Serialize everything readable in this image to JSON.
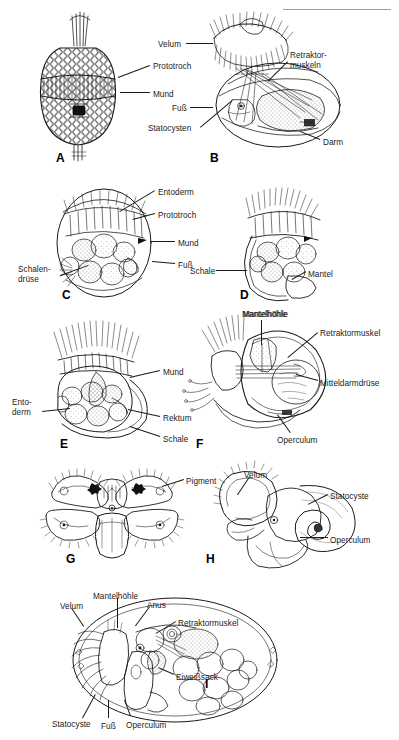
{
  "page": {
    "width": 399,
    "height": 740,
    "background": "#ffffff",
    "ink": "#1a1a1a",
    "header_rule_color": "#9aa0a6",
    "header_text": ""
  },
  "figure": {
    "type": "scientific-illustration-plate",
    "language": "de",
    "panel_count": 9
  },
  "panels": [
    {
      "id": "A",
      "letter": "A",
      "letter_pos": {
        "x": 56,
        "y": 151
      },
      "labels": [
        {
          "text": "Prototroch",
          "x": 153,
          "y": 62,
          "align": "left",
          "leader": {
            "x1": 150,
            "y1": 66,
            "x2": 118,
            "y2": 78
          }
        },
        {
          "text": "Mund",
          "x": 153,
          "y": 90,
          "align": "left",
          "leader": {
            "x1": 150,
            "y1": 93,
            "x2": 120,
            "y2": 93
          }
        }
      ]
    },
    {
      "id": "B",
      "letter": "B",
      "letter_pos": {
        "x": 210,
        "y": 151
      },
      "labels": [
        {
          "text": "Velum",
          "x": 158,
          "y": 40,
          "align": "left",
          "leader": {
            "x1": 186,
            "y1": 43,
            "x2": 213,
            "y2": 43
          }
        },
        {
          "text": "Fuß",
          "x": 172,
          "y": 104,
          "align": "left",
          "leader": {
            "x1": 190,
            "y1": 107,
            "x2": 213,
            "y2": 107
          }
        },
        {
          "text": "Statocysten",
          "x": 148,
          "y": 124,
          "align": "left",
          "leader": {
            "x1": 200,
            "y1": 127,
            "x2": 232,
            "y2": 100
          }
        },
        {
          "text": "Retraktor-",
          "x": 290,
          "y": 51,
          "align": "left",
          "leader": {
            "x1": 288,
            "y1": 62,
            "x2": 268,
            "y2": 82
          }
        },
        {
          "text": "muskeln",
          "x": 290,
          "y": 61,
          "align": "left",
          "leader": null
        },
        {
          "text": "Darm",
          "x": 323,
          "y": 138,
          "align": "left",
          "leader": {
            "x1": 320,
            "y1": 140,
            "x2": 300,
            "y2": 132
          }
        }
      ]
    },
    {
      "id": "C",
      "letter": "C",
      "letter_pos": {
        "x": 62,
        "y": 288
      },
      "labels": [
        {
          "text": "Entoderm",
          "x": 158,
          "y": 188,
          "align": "left",
          "leader": {
            "x1": 155,
            "y1": 191,
            "x2": 120,
            "y2": 212
          }
        },
        {
          "text": "Prototroch",
          "x": 158,
          "y": 211,
          "align": "left",
          "leader": {
            "x1": 155,
            "y1": 214,
            "x2": 133,
            "y2": 220
          }
        },
        {
          "text": "Mund",
          "x": 178,
          "y": 239,
          "align": "left",
          "leader": {
            "x1": 175,
            "y1": 242,
            "x2": 150,
            "y2": 242
          }
        },
        {
          "text": "Fuß",
          "x": 178,
          "y": 261,
          "align": "left",
          "leader": {
            "x1": 175,
            "y1": 264,
            "x2": 152,
            "y2": 262
          }
        },
        {
          "text": "Schalen-",
          "x": 18,
          "y": 265,
          "align": "left",
          "leader": {
            "x1": 60,
            "y1": 275,
            "x2": 88,
            "y2": 265
          }
        },
        {
          "text": "drüse",
          "x": 18,
          "y": 275,
          "align": "left",
          "leader": null
        }
      ]
    },
    {
      "id": "D",
      "letter": "D",
      "letter_pos": {
        "x": 240,
        "y": 288
      },
      "labels": [
        {
          "text": "Schale",
          "x": 190,
          "y": 267,
          "align": "left",
          "leader": {
            "x1": 216,
            "y1": 270,
            "x2": 247,
            "y2": 270
          }
        },
        {
          "text": "Mantel",
          "x": 308,
          "y": 270,
          "align": "left",
          "leader": {
            "x1": 306,
            "y1": 272,
            "x2": 292,
            "y2": 280
          }
        },
        {
          "text": "Mantelhöhle",
          "x": 243,
          "y": 310,
          "align": "left",
          "leader": null
        }
      ]
    },
    {
      "id": "E",
      "letter": "E",
      "letter_pos": {
        "x": 60,
        "y": 437
      },
      "labels": [
        {
          "text": "Mund",
          "x": 163,
          "y": 368,
          "align": "left",
          "leader": {
            "x1": 160,
            "y1": 371,
            "x2": 130,
            "y2": 378
          }
        },
        {
          "text": "Ento-",
          "x": 12,
          "y": 398,
          "align": "left",
          "leader": {
            "x1": 42,
            "y1": 411,
            "x2": 70,
            "y2": 408
          }
        },
        {
          "text": "derm",
          "x": 12,
          "y": 408,
          "align": "left",
          "leader": null
        },
        {
          "text": "Rektum",
          "x": 163,
          "y": 414,
          "align": "left",
          "leader": {
            "x1": 160,
            "y1": 417,
            "x2": 128,
            "y2": 410
          }
        },
        {
          "text": "Schale",
          "x": 163,
          "y": 435,
          "align": "left",
          "leader": {
            "x1": 160,
            "y1": 437,
            "x2": 130,
            "y2": 427
          }
        }
      ]
    },
    {
      "id": "F",
      "letter": "F",
      "letter_pos": {
        "x": 196,
        "y": 437
      },
      "labels": [
        {
          "text": "Mantelhöhle",
          "x": 242,
          "y": 310,
          "align": "left",
          "leader": {
            "x1": 262,
            "y1": 320,
            "x2": 262,
            "y2": 345
          }
        },
        {
          "text": "Retraktormuskel",
          "x": 320,
          "y": 329,
          "align": "left",
          "leader": {
            "x1": 318,
            "y1": 333,
            "x2": 288,
            "y2": 358
          }
        },
        {
          "text": "Mitteldarmdrüse",
          "x": 320,
          "y": 379,
          "align": "left",
          "leader": {
            "x1": 318,
            "y1": 381,
            "x2": 296,
            "y2": 375
          }
        },
        {
          "text": "Operculum",
          "x": 277,
          "y": 436,
          "align": "left",
          "leader": {
            "x1": 290,
            "y1": 433,
            "x2": 277,
            "y2": 415
          }
        }
      ]
    },
    {
      "id": "G",
      "letter": "G",
      "letter_pos": {
        "x": 66,
        "y": 552
      },
      "labels": [
        {
          "text": "Pigment",
          "x": 186,
          "y": 477,
          "align": "left",
          "leader": {
            "x1": 184,
            "y1": 480,
            "x2": 162,
            "y2": 487
          }
        }
      ]
    },
    {
      "id": "H",
      "letter": "H",
      "letter_pos": {
        "x": 206,
        "y": 552
      },
      "labels": [
        {
          "text": "Velum",
          "x": 244,
          "y": 471,
          "align": "left",
          "leader": {
            "x1": 250,
            "y1": 477,
            "x2": 238,
            "y2": 495
          }
        },
        {
          "text": "Statocyste",
          "x": 330,
          "y": 492,
          "align": "left",
          "leader": {
            "x1": 328,
            "y1": 495,
            "x2": 308,
            "y2": 505
          }
        },
        {
          "text": "Operculum",
          "x": 330,
          "y": 536,
          "align": "left",
          "leader": {
            "x1": 328,
            "y1": 538,
            "x2": 300,
            "y2": 538
          }
        }
      ]
    },
    {
      "id": "I",
      "letter": "I",
      "letter_pos": {
        "x": 205,
        "y": 677
      },
      "labels": [
        {
          "text": "Velum",
          "x": 60,
          "y": 602,
          "align": "left",
          "leader": {
            "x1": 72,
            "y1": 608,
            "x2": 84,
            "y2": 626
          }
        },
        {
          "text": "Mantelhöhle",
          "x": 93,
          "y": 592,
          "align": "left",
          "leader": {
            "x1": 118,
            "y1": 598,
            "x2": 118,
            "y2": 628
          }
        },
        {
          "text": "Anus",
          "x": 147,
          "y": 601,
          "align": "left",
          "leader": {
            "x1": 150,
            "y1": 607,
            "x2": 136,
            "y2": 626
          }
        },
        {
          "text": "Retraktormuskel",
          "x": 178,
          "y": 619,
          "align": "left",
          "leader": {
            "x1": 176,
            "y1": 622,
            "x2": 156,
            "y2": 634
          }
        },
        {
          "text": "Eiweißsack",
          "x": 176,
          "y": 673,
          "align": "left",
          "leader": {
            "x1": 174,
            "y1": 675,
            "x2": 158,
            "y2": 668
          }
        },
        {
          "text": "Statocyste",
          "x": 52,
          "y": 720,
          "align": "left",
          "leader": {
            "x1": 82,
            "y1": 718,
            "x2": 95,
            "y2": 694
          }
        },
        {
          "text": "Fuß",
          "x": 101,
          "y": 722,
          "align": "left",
          "leader": {
            "x1": 108,
            "y1": 718,
            "x2": 108,
            "y2": 700
          }
        },
        {
          "text": "Operculum",
          "x": 126,
          "y": 721,
          "align": "left",
          "leader": {
            "x1": 130,
            "y1": 716,
            "x2": 124,
            "y2": 700
          }
        }
      ]
    }
  ]
}
